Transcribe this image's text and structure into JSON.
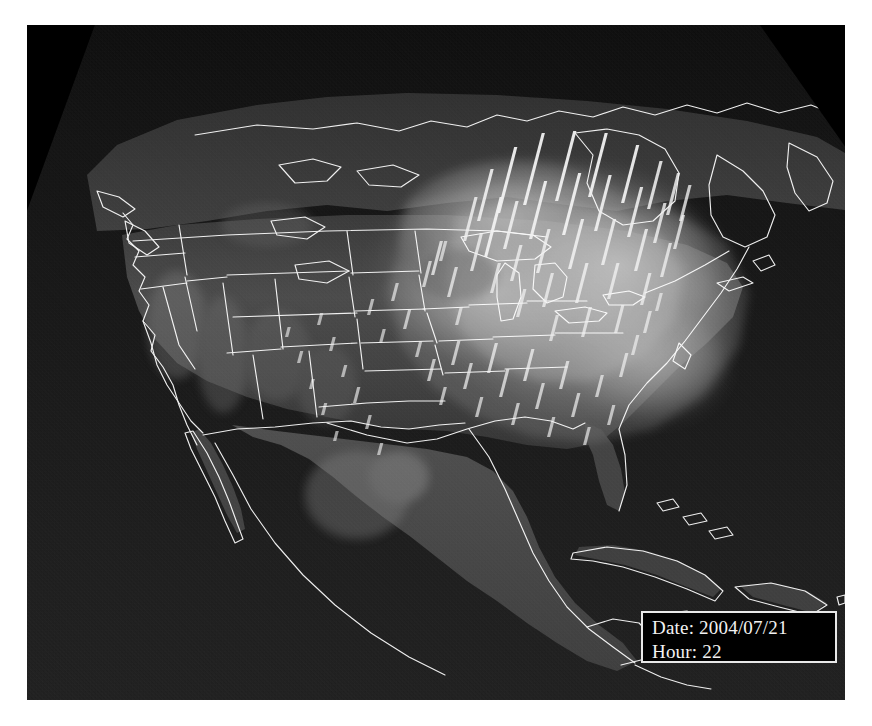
{
  "view": {
    "title": "North America 3D Air Quality Model Visualization",
    "projection": "3d-perspective",
    "basemap": "grayscale-satellite-terrain",
    "background_color": "#ffffff",
    "scene_background_color": "#000000",
    "boundary_color": "#ffffff",
    "plume_color": "#b9b9b9",
    "bar_color": "#f0f0f0"
  },
  "overlay_label": {
    "name": "date-time-readout",
    "date_line": "Date: 2004/07/21",
    "hour_line": "Hour: 22",
    "date_prefix": "Date:",
    "date_value": "2004/07/21",
    "hour_prefix": "Hour:",
    "hour_value": "22",
    "border_color": "#e8e8e8",
    "background_color": "#000000",
    "text_color": "#f2f2f2"
  },
  "chart_data": {
    "type": "map",
    "subtitle": "Date: 2004/07/21  Hour: 22",
    "region": "North America",
    "legend": [],
    "grid": false,
    "bars": {
      "description": "vertical columns rising from surface at station locations",
      "count": 118,
      "units": "relative column height",
      "color": "#f0f0f0",
      "items": [
        {
          "x": 395,
          "y": 262,
          "h": 26
        },
        {
          "x": 404,
          "y": 250,
          "h": 34
        },
        {
          "x": 412,
          "y": 236,
          "h": 20
        },
        {
          "x": 420,
          "y": 272,
          "h": 30
        },
        {
          "x": 428,
          "y": 300,
          "h": 18
        },
        {
          "x": 436,
          "y": 216,
          "h": 44
        },
        {
          "x": 443,
          "y": 246,
          "h": 38
        },
        {
          "x": 450,
          "y": 196,
          "h": 52
        },
        {
          "x": 457,
          "y": 232,
          "h": 60
        },
        {
          "x": 463,
          "y": 268,
          "h": 30
        },
        {
          "x": 470,
          "y": 188,
          "h": 66
        },
        {
          "x": 476,
          "y": 224,
          "h": 48
        },
        {
          "x": 483,
          "y": 256,
          "h": 36
        },
        {
          "x": 489,
          "y": 292,
          "h": 28
        },
        {
          "x": 496,
          "y": 180,
          "h": 72
        },
        {
          "x": 502,
          "y": 214,
          "h": 58
        },
        {
          "x": 509,
          "y": 248,
          "h": 44
        },
        {
          "x": 515,
          "y": 282,
          "h": 34
        },
        {
          "x": 522,
          "y": 316,
          "h": 26
        },
        {
          "x": 528,
          "y": 176,
          "h": 70
        },
        {
          "x": 535,
          "y": 210,
          "h": 62
        },
        {
          "x": 541,
          "y": 244,
          "h": 50
        },
        {
          "x": 548,
          "y": 278,
          "h": 40
        },
        {
          "x": 554,
          "y": 312,
          "h": 30
        },
        {
          "x": 561,
          "y": 172,
          "h": 64
        },
        {
          "x": 567,
          "y": 206,
          "h": 56
        },
        {
          "x": 574,
          "y": 240,
          "h": 46
        },
        {
          "x": 580,
          "y": 274,
          "h": 36
        },
        {
          "x": 587,
          "y": 308,
          "h": 28
        },
        {
          "x": 594,
          "y": 178,
          "h": 58
        },
        {
          "x": 600,
          "y": 212,
          "h": 50
        },
        {
          "x": 607,
          "y": 246,
          "h": 42
        },
        {
          "x": 613,
          "y": 280,
          "h": 32
        },
        {
          "x": 620,
          "y": 184,
          "h": 48
        },
        {
          "x": 626,
          "y": 218,
          "h": 40
        },
        {
          "x": 633,
          "y": 252,
          "h": 34
        },
        {
          "x": 639,
          "y": 190,
          "h": 42
        },
        {
          "x": 646,
          "y": 224,
          "h": 34
        },
        {
          "x": 652,
          "y": 196,
          "h": 36
        },
        {
          "x": 340,
          "y": 290,
          "h": 16
        },
        {
          "x": 352,
          "y": 318,
          "h": 14
        },
        {
          "x": 364,
          "y": 276,
          "h": 18
        },
        {
          "x": 376,
          "y": 304,
          "h": 20
        },
        {
          "x": 388,
          "y": 332,
          "h": 16
        },
        {
          "x": 400,
          "y": 356,
          "h": 22
        },
        {
          "x": 412,
          "y": 380,
          "h": 18
        },
        {
          "x": 424,
          "y": 340,
          "h": 24
        },
        {
          "x": 436,
          "y": 364,
          "h": 26
        },
        {
          "x": 448,
          "y": 392,
          "h": 20
        },
        {
          "x": 460,
          "y": 348,
          "h": 30
        },
        {
          "x": 472,
          "y": 372,
          "h": 28
        },
        {
          "x": 484,
          "y": 400,
          "h": 22
        },
        {
          "x": 496,
          "y": 356,
          "h": 32
        },
        {
          "x": 508,
          "y": 384,
          "h": 26
        },
        {
          "x": 520,
          "y": 412,
          "h": 20
        },
        {
          "x": 532,
          "y": 364,
          "h": 28
        },
        {
          "x": 544,
          "y": 392,
          "h": 24
        },
        {
          "x": 556,
          "y": 420,
          "h": 18
        },
        {
          "x": 568,
          "y": 372,
          "h": 22
        },
        {
          "x": 580,
          "y": 400,
          "h": 20
        },
        {
          "x": 592,
          "y": 352,
          "h": 24
        },
        {
          "x": 604,
          "y": 330,
          "h": 20
        },
        {
          "x": 616,
          "y": 308,
          "h": 22
        },
        {
          "x": 628,
          "y": 286,
          "h": 18
        },
        {
          "x": 290,
          "y": 300,
          "h": 12
        },
        {
          "x": 302,
          "y": 326,
          "h": 14
        },
        {
          "x": 314,
          "y": 352,
          "h": 12
        },
        {
          "x": 326,
          "y": 378,
          "h": 16
        },
        {
          "x": 338,
          "y": 404,
          "h": 14
        },
        {
          "x": 350,
          "y": 430,
          "h": 12
        },
        {
          "x": 258,
          "y": 312,
          "h": 10
        },
        {
          "x": 270,
          "y": 338,
          "h": 12
        },
        {
          "x": 282,
          "y": 364,
          "h": 10
        },
        {
          "x": 294,
          "y": 390,
          "h": 12
        },
        {
          "x": 306,
          "y": 416,
          "h": 10
        }
      ]
    },
    "plume": {
      "description": "elevated concentration region over eastern United States extending offshore",
      "fill_levels": [
        {
          "level": 1,
          "opacity": 0.18
        },
        {
          "level": 2,
          "opacity": 0.3
        },
        {
          "level": 3,
          "opacity": 0.46
        }
      ]
    },
    "boundaries": {
      "us_states": true,
      "national_borders": true,
      "coastlines": true,
      "great_lakes": true,
      "color": "#ffffff",
      "line_width": 1.1
    }
  }
}
